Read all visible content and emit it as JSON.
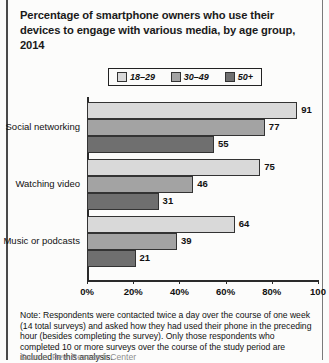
{
  "title": "Percentage of smartphone owners who use their devices to engage with various media, by age group, 2014",
  "note": "Note: Respondents were contacted twice a day over the course of one week (14 total surveys) and asked how they had used their phone in the preceding hour (besides completing the survey). Only those respondents who completed 10 or more surveys over the course of the study period are included in this analysis.",
  "source_partial": "Source: Pew Research Center",
  "colors": {
    "series_18_29": "#d9d9d9",
    "series_30_49": "#a3a3a3",
    "series_50_plus": "#6f6f6f",
    "axis": "#2a2a2a",
    "text": "#111111"
  },
  "chart_data": {
    "type": "bar",
    "orientation": "horizontal",
    "title": "Percentage of smartphone owners who use their devices to engage with various media, by age group, 2014",
    "xlabel": "",
    "ylabel": "",
    "xlim": [
      0,
      100
    ],
    "xticks": [
      0,
      20,
      40,
      60,
      80,
      100
    ],
    "xticklabels": [
      "0%",
      "20%",
      "40%",
      "60%",
      "80%",
      "100"
    ],
    "grid": false,
    "legend_position": "top-center",
    "categories": [
      "Social networking",
      "Watching video",
      "Music or podcasts"
    ],
    "series": [
      {
        "name": "18–29",
        "color": "#d9d9d9",
        "values": [
          91,
          75,
          64
        ]
      },
      {
        "name": "30–49",
        "color": "#a3a3a3",
        "values": [
          77,
          46,
          39
        ]
      },
      {
        "name": "50+",
        "color": "#6f6f6f",
        "values": [
          55,
          31,
          21
        ]
      }
    ]
  }
}
